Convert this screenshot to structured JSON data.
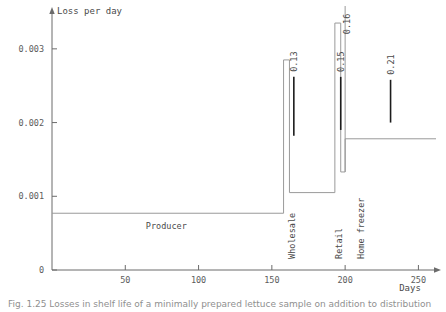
{
  "figure": {
    "caption": "Fig. 1.25  Losses in shelf life of a minimally prepared lettuce sample on addition to distribution"
  },
  "chart_data": {
    "type": "line",
    "title": "",
    "xlabel": "Days",
    "ylabel": "Loss per day",
    "xlim": [
      0,
      262
    ],
    "ylim": [
      0,
      0.0035
    ],
    "grid": false,
    "legend_position": "none",
    "x_ticks": [
      50,
      100,
      150,
      200,
      250
    ],
    "x_tick_labels": [
      "50",
      "100",
      "150",
      "200",
      "250"
    ],
    "y_ticks": [
      0,
      0.001,
      0.002,
      0.003
    ],
    "y_tick_labels": [
      "0",
      "0.001",
      "0.002",
      "0.003"
    ],
    "series": [
      {
        "name": "Loss per day",
        "style": "step",
        "x": [
          0,
          158,
          158,
          162,
          162,
          193,
          193,
          197,
          197,
          200,
          200,
          262
        ],
        "y": [
          0.00077,
          0.00077,
          0.00285,
          0.00285,
          0.00105,
          0.00105,
          0.00335,
          0.00335,
          0.00133,
          0.00133,
          0.00178,
          0.00178
        ]
      }
    ],
    "stage_labels": [
      {
        "label": "Producer",
        "x": 78,
        "y": 0.00055,
        "rotation": 0
      },
      {
        "label": "Wholesale",
        "x": 166,
        "y": 0.00015,
        "rotation": -90
      },
      {
        "label": "Retail",
        "x": 198,
        "y": 0.00015,
        "rotation": -90
      },
      {
        "label": "Home freezer",
        "x": 213,
        "y": 0.00015,
        "rotation": -90
      }
    ],
    "annotations": [
      {
        "label": "0.13",
        "x": 165,
        "y_top": 0.00262,
        "y_bottom": 0.00182,
        "rotation": -90
      },
      {
        "label": "0.15",
        "x": 197,
        "y_top": 0.00262,
        "y_bottom": 0.0019,
        "rotation": -90
      },
      {
        "label": "0.16",
        "x": 203,
        "y_top": 0.0032,
        "y_bottom": 0.0032,
        "rotation": -90
      },
      {
        "label": "0.21",
        "x": 231,
        "y_top": 0.00258,
        "y_bottom": 0.002,
        "rotation": -90
      }
    ]
  },
  "colors": {
    "axis": "#6b6b6b",
    "data_line": "#9a9a9a",
    "marker": "#1c1c1c",
    "text": "#4a4a4a",
    "background": "#ffffff"
  }
}
